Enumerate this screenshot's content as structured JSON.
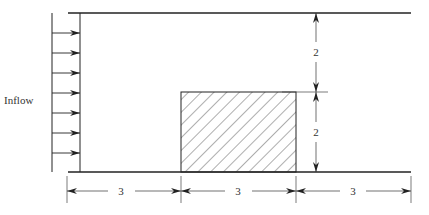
{
  "diagram": {
    "inflow_label": "Inflow",
    "arrow_count": 7,
    "dimensions": {
      "upstream_length": "3",
      "block_width": "3",
      "downstream_length": "3",
      "upper_gap_height": "2",
      "block_height": "2"
    },
    "colors": {
      "line": "#222222",
      "hatch": "#333333",
      "background": "#ffffff"
    }
  }
}
